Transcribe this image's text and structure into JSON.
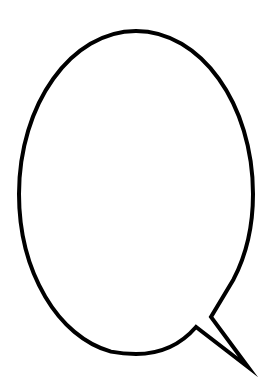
{
  "artwork": {
    "title": "Speech Bubble Outline",
    "kind": "speech-balloon",
    "caption_text": "",
    "background_color": "#ffffff",
    "fill_color": "#ffffff",
    "stroke_color": "#000000",
    "stroke_width": 4,
    "canvas": {
      "width": 275,
      "height": 390
    },
    "balloon": {
      "center_x": 136,
      "center_y": 192,
      "radius_x": 117,
      "radius_y": 161,
      "left": 19,
      "right": 253,
      "top": 31,
      "bottom": 353
    },
    "tail": {
      "notch_apex_x": 211,
      "notch_apex_y": 317,
      "tip_x": 248,
      "tip_y": 367,
      "base_vertex_x": 196,
      "base_vertex_y": 327,
      "direction": "down-right"
    },
    "outline_path": "M 233.6 279.2 C 245.9 255.6 253 226.0 253 194.0 C 253 104.0 200.6 31 136 31 C 71.4 31 19 104.0 19 194.0 C 19 272.0 58.4 337.2 111.0 351.6 C 119.1 353.2 127.4 354.0 136 354.0 C 160.6 354.0 181.0 344.4 196.0 327.0 L 248.0 367.0 L 211.0 317.0 Z"
  }
}
